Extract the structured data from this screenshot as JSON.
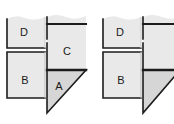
{
  "diagram": {
    "background_color": "#ffffff",
    "panel_fill": "#e9e9e9",
    "triangle_fill": "#d6d6d6",
    "stroke_color": "#1c1c1c",
    "soft_edge_color": "#cfcfcf",
    "figures": [
      {
        "id": "figure-left",
        "name": "left-figure",
        "complete": true,
        "regions": [
          {
            "id": "region-d-left",
            "label": "D",
            "shape": "rectangle",
            "label_x": 24,
            "label_y": 32
          },
          {
            "id": "region-c-left",
            "label": "C",
            "shape": "rectangle",
            "label_x": 66,
            "label_y": 51
          },
          {
            "id": "region-b-left",
            "label": "B",
            "shape": "rectangle",
            "label_x": 24,
            "label_y": 80
          },
          {
            "id": "region-a-left",
            "label": "A",
            "shape": "triangle",
            "label_x": 58,
            "label_y": 86
          }
        ]
      },
      {
        "id": "figure-right",
        "name": "right-figure",
        "complete": false,
        "clipped_at_right_edge": true,
        "regions": [
          {
            "id": "region-d-right",
            "label": "D",
            "shape": "rectangle",
            "label_x": 120,
            "label_y": 32
          },
          {
            "id": "region-c-right",
            "label": "",
            "shape": "rectangle",
            "label_x": 162,
            "label_y": 51
          },
          {
            "id": "region-b-right",
            "label": "B",
            "shape": "rectangle",
            "label_x": 120,
            "label_y": 80
          },
          {
            "id": "region-a-right",
            "label": "",
            "shape": "triangle",
            "label_x": 154,
            "label_y": 86
          }
        ]
      }
    ]
  }
}
